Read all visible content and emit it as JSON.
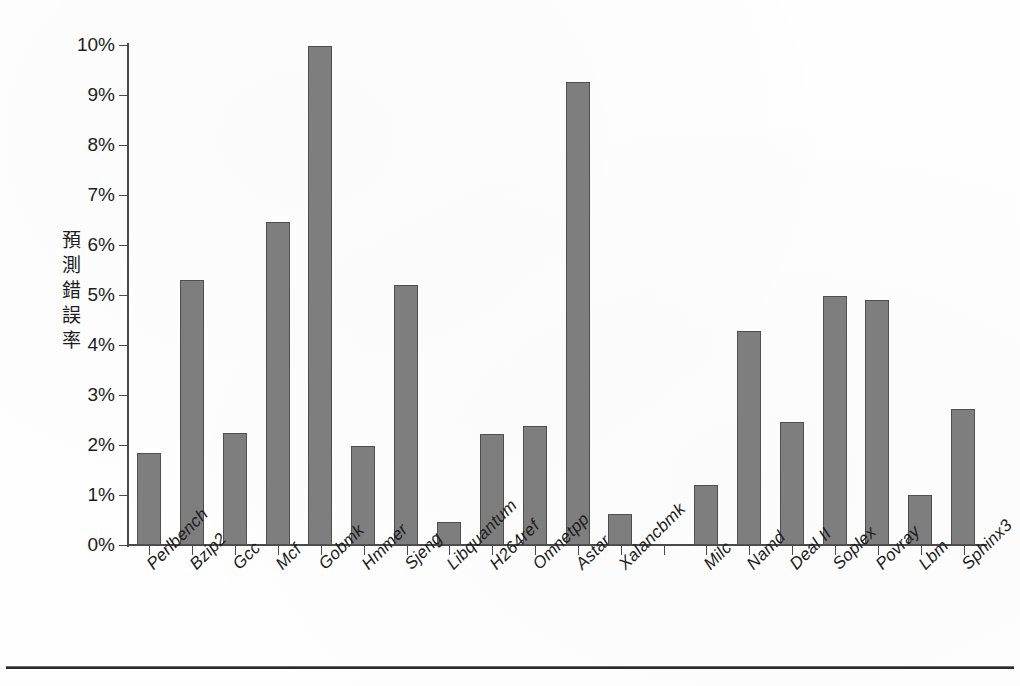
{
  "figure": {
    "y_axis_title": "預測錯誤率",
    "bottom_rule": "horizontal-rule"
  },
  "chart_data": {
    "type": "bar",
    "title": "",
    "xlabel": "",
    "ylabel": "預測錯誤率",
    "ylim": [
      0,
      10
    ],
    "y_tick_labels": [
      "0%",
      "1%",
      "2%",
      "3%",
      "4%",
      "5%",
      "6%",
      "7%",
      "8%",
      "9%",
      "10%"
    ],
    "y_tick_values": [
      0,
      1,
      2,
      3,
      4,
      5,
      6,
      7,
      8,
      9,
      10
    ],
    "y_unit": "%",
    "grid": false,
    "legend": "none",
    "categories": [
      "Perlbench",
      "Bzip2",
      "Gcc",
      "Mcf",
      "Gobmk",
      "Hmmer",
      "Sjeng",
      "Libquantum",
      "H264ref",
      "Omnetpp",
      "Astar",
      "Xalancbmk",
      "",
      "Milc",
      "Namd",
      "Deal II",
      "Soplex",
      "Povray",
      "Lbm",
      "Sphinx3"
    ],
    "values": [
      1.83,
      5.3,
      2.23,
      6.46,
      9.98,
      1.98,
      5.2,
      0.46,
      2.22,
      2.38,
      9.25,
      0.61,
      null,
      1.2,
      4.28,
      2.45,
      4.98,
      4.9,
      1.0,
      2.72
    ],
    "groups": [
      {
        "name": "integer-benchmarks",
        "start_index": 0,
        "end_index": 11
      },
      {
        "name": "floating-point-benchmarks",
        "start_index": 13,
        "end_index": 19
      }
    ],
    "gap_index": 12,
    "bar_color": "#7e7e7e",
    "bar_edge_color": "#4f4f4f",
    "axis_color": "#4a4a4a",
    "background_color": "#ffffff"
  }
}
